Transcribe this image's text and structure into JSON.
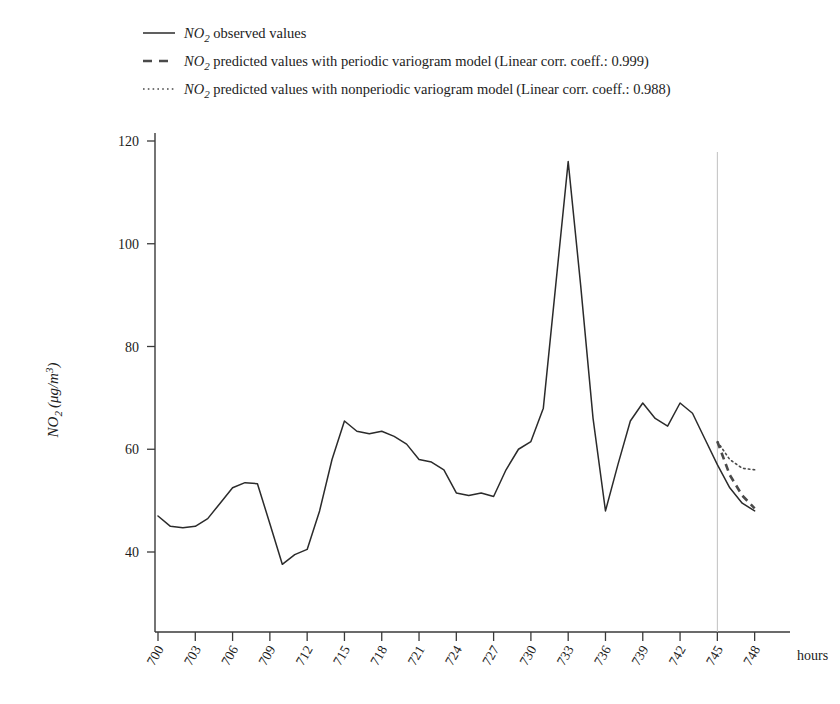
{
  "chart_data": {
    "type": "line",
    "title": "",
    "xlabel": "hours",
    "ylabel": "NO2 (ug/m^3)",
    "ylabel_parts": {
      "species": "NO",
      "sub": "2",
      "units": "(μg/m",
      "unit_sup": "3",
      "close": ")"
    },
    "xlim": [
      700,
      749
    ],
    "ylim": [
      33,
      124
    ],
    "yticks": [
      40,
      60,
      80,
      100,
      120
    ],
    "xticks": [
      700,
      703,
      706,
      709,
      712,
      715,
      718,
      721,
      724,
      727,
      730,
      733,
      736,
      739,
      742,
      745,
      748
    ],
    "xticks_all": [
      700,
      701,
      702,
      703,
      704,
      705,
      706,
      707,
      708,
      709,
      710,
      711,
      712,
      713,
      714,
      715,
      716,
      717,
      718,
      719,
      720,
      721,
      722,
      723,
      724,
      725,
      726,
      727,
      728,
      729,
      730,
      731,
      732,
      733,
      734,
      735,
      736,
      737,
      738,
      739,
      740,
      741,
      742,
      743,
      744,
      745,
      746,
      747,
      748
    ],
    "grid": false,
    "legend_position": "top-left",
    "forecast_start_hour": 745,
    "annotations": [
      {
        "name": "forecast-divider",
        "type": "vline",
        "x": 745,
        "color": "#c0c0c0"
      }
    ],
    "series": [
      {
        "name": "NO2 observed values",
        "style": "solid",
        "color": "#2b2b2b",
        "x": [
          700,
          701,
          702,
          703,
          704,
          705,
          706,
          707,
          708,
          709,
          710,
          711,
          712,
          713,
          714,
          715,
          716,
          717,
          718,
          719,
          720,
          721,
          722,
          723,
          724,
          725,
          726,
          727,
          728,
          729,
          730,
          731,
          732,
          733,
          734,
          735,
          736,
          737,
          738,
          739,
          740,
          741,
          742,
          743,
          744,
          745,
          746,
          747,
          748
        ],
        "values": [
          47.0,
          45.0,
          44.7,
          45.0,
          46.5,
          49.5,
          52.5,
          53.5,
          53.3,
          45.5,
          37.6,
          39.5,
          40.5,
          48.0,
          58.0,
          65.5,
          63.5,
          63.0,
          63.5,
          62.5,
          61.0,
          58.0,
          57.5,
          56.0,
          51.5,
          51.0,
          51.5,
          50.8,
          56.0,
          60.0,
          61.5,
          68.0,
          92.0,
          116.0,
          92.0,
          66.0,
          48.0,
          57.0,
          65.5,
          69.0,
          66.0,
          64.5,
          69.0,
          67.0,
          62.0,
          57.0,
          52.5,
          49.5,
          48.0
        ]
      },
      {
        "name": "NO2 predicted values with periodic variogram model",
        "style": "dashed",
        "color": "#4a4a4a",
        "corr_coeff": "0.999",
        "x": [
          745,
          746,
          747,
          748
        ],
        "values": [
          61.5,
          55.0,
          51.0,
          48.5
        ]
      },
      {
        "name": "NO2 predicted values with nonperiodic variogram model",
        "style": "dotted",
        "color": "#4a4a4a",
        "corr_coeff": "0.988",
        "x": [
          745,
          746,
          747,
          748
        ],
        "values": [
          61.5,
          58.0,
          56.3,
          56.0
        ]
      }
    ]
  },
  "legend": {
    "entries": [
      {
        "key": "observed",
        "sample": "solid-line-sample",
        "species": "NO",
        "subscript": "2",
        "text": " observed values",
        "suffix": ""
      },
      {
        "key": "periodic",
        "sample": "dashed-line-sample",
        "species": "NO",
        "subscript": "2",
        "text": " predicted values with periodic variogram model",
        "suffix": "(Linear corr. coeff.: 0.999)"
      },
      {
        "key": "nonperiodic",
        "sample": "dotted-line-sample",
        "species": "NO",
        "subscript": "2",
        "text": " predicted values with nonperiodic variogram model",
        "suffix": "(Linear corr. coeff.: 0.988)"
      }
    ]
  },
  "axes": {
    "y_title_species": "NO",
    "y_title_sub": "2",
    "y_title_units_open": "(μg/m",
    "y_title_units_sup": "3",
    "y_title_units_close": ")",
    "x_title": "hours",
    "ytick_labels": [
      "40",
      "60",
      "80",
      "100",
      "120"
    ],
    "xtick_labels": [
      "700",
      "703",
      "706",
      "709",
      "712",
      "715",
      "718",
      "721",
      "724",
      "727",
      "730",
      "733",
      "736",
      "739",
      "742",
      "745",
      "748"
    ]
  },
  "colors": {
    "observed": "#2b2b2b",
    "predicted": "#4a4a4a",
    "axis": "#3a3a3a",
    "reference_line": "#c0c0c0",
    "background": "#ffffff"
  }
}
